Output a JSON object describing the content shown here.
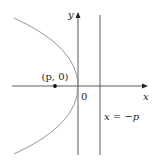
{
  "diagram": {
    "colors": {
      "axis": "#333333",
      "curve": "#8a8a8a",
      "directrix": "#333333",
      "focus": "#111111",
      "background": "#ffffff"
    },
    "axes": {
      "x_label": "x",
      "y_label": "y",
      "origin_label": "0"
    },
    "focus": {
      "label": "(p, 0)"
    },
    "directrix": {
      "label": "x = −p"
    },
    "curve": {
      "type": "parabola",
      "opens": "left"
    }
  }
}
